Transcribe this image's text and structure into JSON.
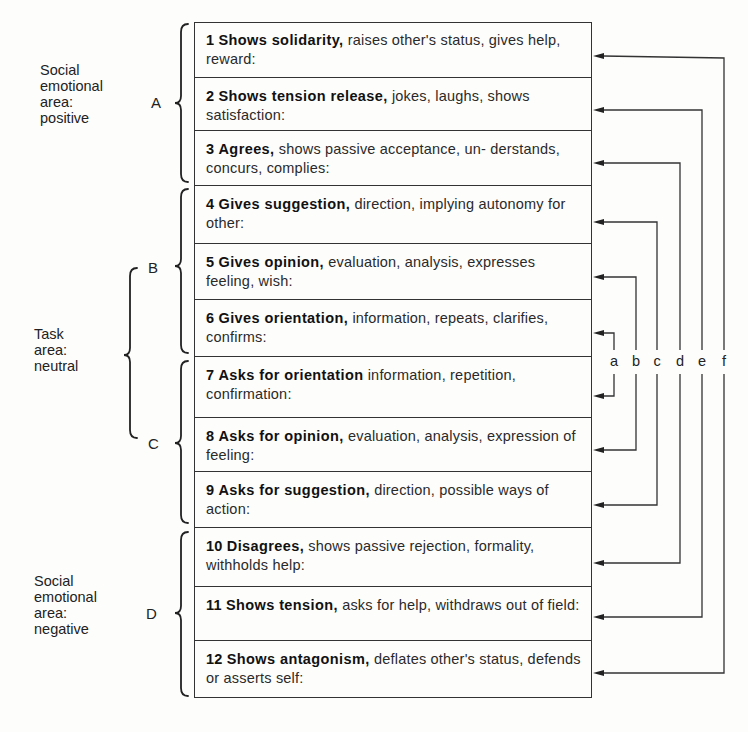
{
  "diagram": {
    "areas": [
      {
        "id": "social-positive",
        "lines": [
          "Social",
          "emotional",
          "area:",
          "positive"
        ]
      },
      {
        "id": "task-neutral",
        "lines": [
          "Task",
          "area:",
          "neutral"
        ]
      },
      {
        "id": "social-negative",
        "lines": [
          "Social",
          "emotional",
          "area:",
          "negative"
        ]
      }
    ],
    "groups": [
      "A",
      "B",
      "C",
      "D"
    ],
    "categories": [
      {
        "num": "1",
        "head": "Shows solidarity,",
        "rest": " raises other's status, gives help, reward:"
      },
      {
        "num": "2",
        "head": "Shows tension release,",
        "rest": " jokes, laughs, shows satisfaction:"
      },
      {
        "num": "3",
        "head": "Agrees,",
        "rest": " shows passive acceptance, un- derstands, concurs, complies:"
      },
      {
        "num": "4",
        "head": "Gives suggestion,",
        "rest": " direction, implying autonomy for other:"
      },
      {
        "num": "5",
        "head": "Gives opinion,",
        "rest": " evaluation, analysis, expresses feeling, wish:"
      },
      {
        "num": "6",
        "head": "Gives orientation,",
        "rest": " information, repeats, clarifies, confirms:"
      },
      {
        "num": "7",
        "head": "Asks for orientation",
        "rest": " information, repetition, confirmation:"
      },
      {
        "num": "8",
        "head": "Asks for opinion,",
        "rest": " evaluation, analysis, expression of feeling:"
      },
      {
        "num": "9",
        "head": "Asks for suggestion,",
        "rest": " direction, possible ways of action:"
      },
      {
        "num": "10",
        "head": "Disagrees,",
        "rest": " shows passive rejection, formality, withholds help:"
      },
      {
        "num": "11",
        "head": "Shows tension,",
        "rest": " asks for help, withdraws out of field:"
      },
      {
        "num": "12",
        "head": "Shows antagonism,",
        "rest": " deflates other's status, defends or asserts self:"
      }
    ],
    "connectors": [
      {
        "label": "a",
        "pair": [
          6,
          7
        ]
      },
      {
        "label": "b",
        "pair": [
          5,
          8
        ]
      },
      {
        "label": "c",
        "pair": [
          4,
          9
        ]
      },
      {
        "label": "d",
        "pair": [
          3,
          10
        ]
      },
      {
        "label": "e",
        "pair": [
          2,
          11
        ]
      },
      {
        "label": "f",
        "pair": [
          1,
          12
        ]
      }
    ],
    "line_color": "#333333"
  }
}
